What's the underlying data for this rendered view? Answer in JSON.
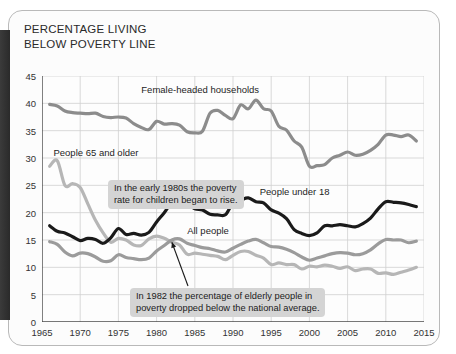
{
  "title": {
    "line1": "PERCENTAGE LIVING",
    "line2": "BELOW POVERTY LINE"
  },
  "chart_data": {
    "type": "line",
    "title": "PERCENTAGE LIVING BELOW POVERTY LINE",
    "xlabel": "",
    "ylabel": "",
    "xlim": [
      1965,
      2015
    ],
    "ylim": [
      0,
      45
    ],
    "grid": true,
    "legend_position": "inline-labels",
    "xticks": [
      "1965",
      "1970",
      "1975",
      "1980",
      "1985",
      "1990",
      "1995",
      "2000",
      "2005",
      "2010",
      "2015"
    ],
    "yticks": [
      "0",
      "5",
      "10",
      "15",
      "20",
      "25",
      "30",
      "35",
      "40",
      "45"
    ],
    "x": [
      1966,
      1967,
      1968,
      1969,
      1970,
      1971,
      1972,
      1973,
      1974,
      1975,
      1976,
      1977,
      1978,
      1979,
      1980,
      1981,
      1982,
      1983,
      1984,
      1985,
      1986,
      1987,
      1988,
      1989,
      1990,
      1991,
      1992,
      1993,
      1994,
      1995,
      1996,
      1997,
      1998,
      1999,
      2000,
      2001,
      2002,
      2003,
      2004,
      2005,
      2006,
      2007,
      2008,
      2009,
      2010,
      2011,
      2012,
      2013,
      2014
    ],
    "series": [
      {
        "name": "Female-headed households",
        "color": "#8c8c8c",
        "label_x": 1978,
        "label_y": 42.5,
        "values": [
          39.8,
          39.5,
          38.6,
          38.3,
          38.2,
          38.1,
          38.2,
          37.6,
          37.4,
          37.5,
          37.3,
          36.3,
          35.6,
          35.2,
          36.7,
          36.2,
          36.3,
          36.0,
          34.8,
          34.6,
          34.9,
          38.2,
          38.7,
          37.8,
          37.2,
          39.7,
          39.0,
          40.6,
          39.0,
          38.6,
          35.8,
          35.1,
          33.1,
          32.0,
          28.5,
          28.6,
          28.8,
          30.0,
          30.5,
          31.1,
          30.5,
          30.7,
          31.4,
          32.5,
          34.2,
          34.2,
          33.9,
          34.2,
          33.1
        ]
      },
      {
        "name": "People under 18",
        "color": "#1a1a1a",
        "label_x": 1993.5,
        "label_y": 23.8,
        "values": [
          17.6,
          16.6,
          16.3,
          15.6,
          14.9,
          15.3,
          15.1,
          14.4,
          15.4,
          17.1,
          16.0,
          16.2,
          15.9,
          16.4,
          18.3,
          20.0,
          21.9,
          22.3,
          21.8,
          20.7,
          20.5,
          19.7,
          19.6,
          19.6,
          21.8,
          22.3,
          22.7,
          22.0,
          21.8,
          20.5,
          19.9,
          18.9,
          16.9,
          16.2,
          15.8,
          16.3,
          17.6,
          17.6,
          17.8,
          17.6,
          17.4,
          18.0,
          19.0,
          20.7,
          22.0,
          21.9,
          21.8,
          21.5,
          21.1
        ]
      },
      {
        "name": "All people",
        "color": "#9b9b9b",
        "label_x": 1984,
        "label_y": 16.6,
        "values": [
          14.7,
          14.2,
          12.8,
          12.1,
          12.6,
          12.5,
          11.9,
          11.1,
          11.2,
          12.3,
          11.8,
          11.6,
          11.4,
          11.7,
          13.0,
          14.0,
          15.0,
          15.2,
          14.4,
          14.0,
          13.6,
          13.4,
          13.0,
          12.8,
          13.5,
          14.2,
          14.8,
          15.1,
          14.5,
          13.8,
          13.7,
          13.3,
          12.7,
          11.9,
          11.3,
          11.7,
          12.1,
          12.5,
          12.7,
          12.6,
          12.3,
          12.5,
          13.2,
          14.3,
          15.1,
          15.0,
          15.0,
          14.5,
          14.8
        ]
      },
      {
        "name": "People 65 and older",
        "color": "#b6b6b6",
        "label_x": 1966.5,
        "label_y": 31.0,
        "values": [
          28.5,
          29.5,
          25.0,
          25.3,
          24.6,
          21.6,
          18.6,
          16.3,
          14.6,
          15.3,
          15.0,
          14.1,
          14.0,
          15.2,
          15.7,
          15.3,
          14.6,
          14.1,
          12.4,
          12.6,
          12.4,
          12.2,
          12.0,
          11.4,
          12.2,
          12.9,
          12.9,
          12.2,
          11.7,
          10.5,
          10.8,
          10.5,
          10.5,
          9.7,
          10.2,
          10.1,
          10.4,
          10.2,
          9.8,
          10.1,
          9.4,
          9.7,
          9.7,
          8.9,
          9.0,
          8.7,
          9.1,
          9.5,
          10.0
        ]
      }
    ],
    "annotations": [
      {
        "name": "children-rise-callout",
        "line1": "In the early 1980s the poverty",
        "line2": "rate for children began to rise.",
        "points_to": {
          "x": 1983,
          "y": 22.3
        }
      },
      {
        "name": "elderly-below-average-callout",
        "line1": "In 1982 the percentage of elderly people in",
        "line2": "poverty dropped below the national average.",
        "points_to": {
          "x": 1982,
          "y": 14.6
        }
      }
    ]
  }
}
